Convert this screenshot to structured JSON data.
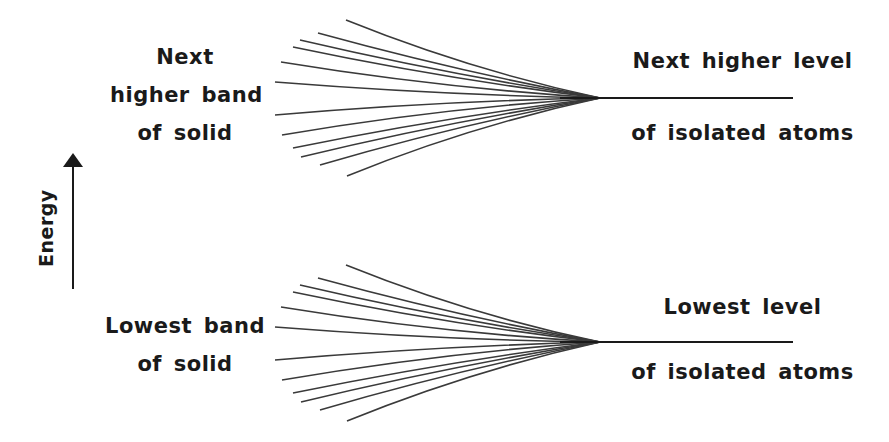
{
  "diagram": {
    "type": "energy-band-formation",
    "axis": {
      "label": "Energy",
      "direction": "up"
    },
    "upper": {
      "solid_label": [
        "Next",
        "higher band",
        "of solid"
      ],
      "atom_label_top": "Next higher level",
      "atom_label_bottom": "of isolated atoms",
      "converge_y": 98
    },
    "lower": {
      "solid_label": [
        "Lowest band",
        "of solid"
      ],
      "atom_label_top": "Lowest level",
      "atom_label_bottom": "of isolated atoms",
      "converge_y": 342
    },
    "colors": {
      "line": "#3a3a3a",
      "text": "#1a1a1a",
      "background": "#ffffff"
    }
  }
}
